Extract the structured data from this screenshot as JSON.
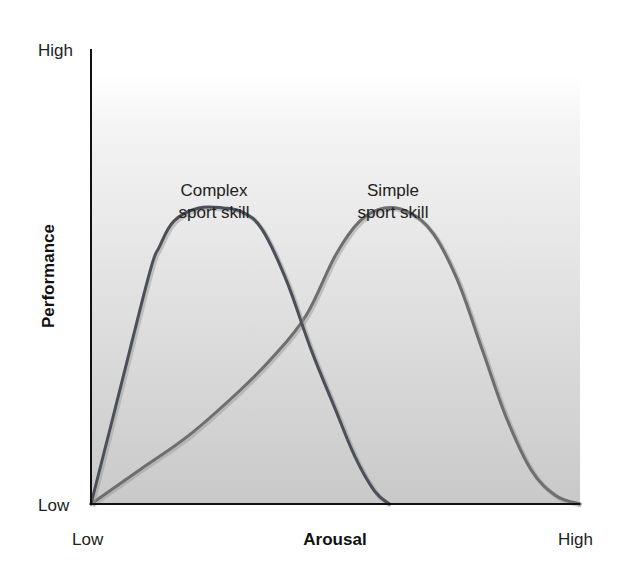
{
  "chart_data": {
    "type": "line",
    "title": "",
    "xlabel": "Arousal",
    "ylabel": "Performance",
    "x_ticks": [
      "Low",
      "High"
    ],
    "y_ticks": [
      "Low",
      "High"
    ],
    "xlim": [
      0,
      100
    ],
    "ylim": [
      0,
      100
    ],
    "grid": false,
    "legend": "inline labels above curves",
    "background": {
      "gradient_top": "#ffffff",
      "gradient_bottom": "#c9c9c9"
    },
    "series": [
      {
        "name": "Complex sport skill",
        "label_lines": [
          "Complex",
          "sport skill"
        ],
        "color": "#4a4f5a",
        "x": [
          0,
          6,
          12,
          14,
          17,
          22,
          27,
          31,
          35,
          40,
          45,
          50,
          54,
          58,
          61
        ],
        "y": [
          0,
          27,
          54,
          60,
          66,
          69,
          69,
          68,
          64,
          52,
          36,
          22,
          11,
          3,
          0
        ]
      },
      {
        "name": "Simple sport skill",
        "label_lines": [
          "Simple",
          "sport skill"
        ],
        "color": "#6e6e6e",
        "x": [
          0,
          10,
          20,
          30,
          37,
          44,
          50,
          55,
          60,
          65,
          70,
          75,
          80,
          85,
          90,
          95,
          100
        ],
        "y": [
          0,
          8,
          16,
          26,
          34,
          44,
          58,
          66,
          69,
          68,
          63,
          52,
          36,
          20,
          8,
          2,
          0
        ]
      }
    ]
  }
}
